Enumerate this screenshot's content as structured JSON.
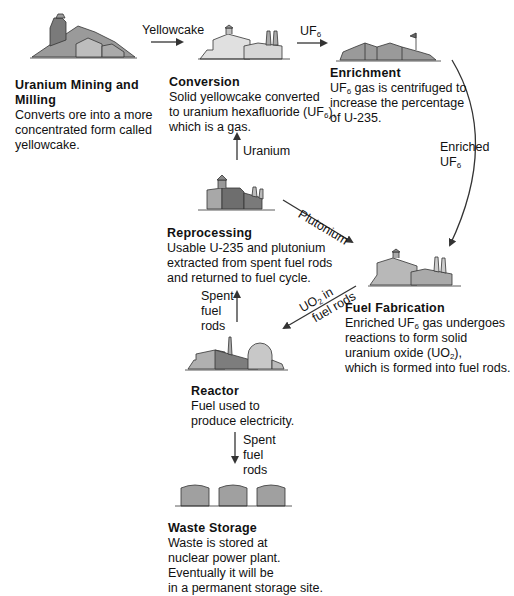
{
  "diagram": {
    "type": "nuclear-fuel-cycle",
    "stages": [
      {
        "id": "mining",
        "title_line1": "Uranium Mining and",
        "title_line2": "Milling",
        "desc": [
          "Converts ore into a more",
          "concentrated form called",
          "yellowcake."
        ]
      },
      {
        "id": "conversion",
        "title": "Conversion",
        "desc1": "Solid yellowcake converted",
        "desc2a": "to uranium hexafluoride (UF",
        "desc2sub": "6",
        "desc2b": "),",
        "desc3": "which is a gas."
      },
      {
        "id": "enrichment",
        "title": "Enrichment",
        "desc1a": "UF",
        "desc1sub": "6",
        "desc1b": " gas is centrifuged to",
        "desc2": "increase the percentage",
        "desc3": "of U-235."
      },
      {
        "id": "reprocessing",
        "title": "Reprocessing",
        "desc": [
          "Usable U-235 and plutonium",
          "extracted from spent fuel rods",
          "and returned to fuel cycle."
        ]
      },
      {
        "id": "fabrication",
        "title": "Fuel Fabrication",
        "desc1a": "Enriched UF",
        "desc1sub": "6",
        "desc1b": " gas undergoes",
        "desc2": "reactions to form solid",
        "desc3a": "uranium oxide (UO",
        "desc3sub": "2",
        "desc3b": "),",
        "desc4": "which is formed into fuel rods."
      },
      {
        "id": "reactor",
        "title": "Reactor",
        "desc": [
          "Fuel used to",
          "produce electricity."
        ]
      },
      {
        "id": "waste",
        "title": "Waste Storage",
        "desc": [
          "Waste is stored at",
          "nuclear power plant.",
          "Eventually it will be",
          "in a permanent storage site."
        ]
      }
    ],
    "flows": {
      "yellowcake": "Yellowcake",
      "uf6_a": "UF",
      "uf6_sub": "6",
      "enriched_line1": "Enriched",
      "enriched_a": "UF",
      "enriched_sub": "6",
      "uranium": "Uranium",
      "plutonium": "Plutonium",
      "uo2_a": "UO",
      "uo2_sub": "2",
      "uo2_b": " in",
      "uo2_line2": "fuel rods",
      "spent_up": [
        "Spent",
        "fuel",
        "rods"
      ],
      "spent_down": [
        "Spent",
        "fuel",
        "rods"
      ]
    },
    "colors": {
      "light": "#d9d9d9",
      "mid": "#a8a8a8",
      "dark": "#7a7a7a",
      "outline": "#333333",
      "arrow": "#333333"
    }
  }
}
